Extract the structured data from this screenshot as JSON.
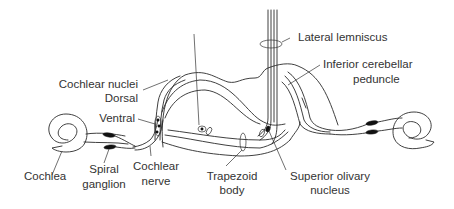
{
  "diagram": {
    "labels": {
      "lateral_lemniscus": "Lateral lemniscus",
      "inferior_cerebellar_peduncle_1": "Inferior cerebellar",
      "inferior_cerebellar_peduncle_2": "peduncle",
      "cochlear_nuclei": "Cochlear nuclei",
      "dorsal": "Dorsal",
      "ventral": "Ventral",
      "cochlea": "Cochlea",
      "spiral_ganglion_1": "Spiral",
      "spiral_ganglion_2": "ganglion",
      "cochlear_nerve_1": "Cochlear",
      "cochlear_nerve_2": "nerve",
      "trapezoid_body_1": "Trapezoid",
      "trapezoid_body_2": "body",
      "superior_olivary_nucleus_1": "Superior olivary",
      "superior_olivary_nucleus_2": "nucleus"
    },
    "colors": {
      "line": "#2a2a2a",
      "text": "#333333",
      "background": "#ffffff"
    }
  }
}
